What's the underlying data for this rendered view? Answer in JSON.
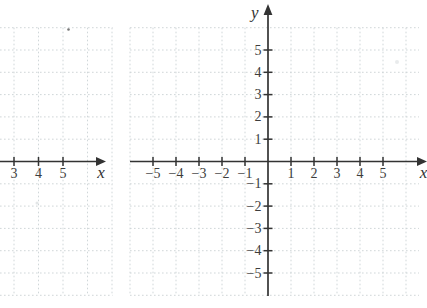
{
  "figure": {
    "background": "#ffffff"
  },
  "colors": {
    "axis": "#333333",
    "tick_label": "#3d3d3d",
    "grid": "#ccd3d5"
  },
  "chart_data": [
    {
      "type": "scatter",
      "title": "",
      "xlabel": "x",
      "ylabel": "",
      "x_ticks": [
        3,
        4,
        5
      ],
      "x_tick_labels": [
        "3",
        "4",
        "5"
      ],
      "y_ticks": [],
      "y_tick_labels": [],
      "grid": true,
      "legend": false,
      "series": [],
      "note": "left coordinate plane, cropped by image edge; only x-axis ticks 3 to 5 and right arrow visible"
    },
    {
      "type": "scatter",
      "title": "",
      "xlabel": "x",
      "ylabel": "y",
      "x_ticks": [
        -5,
        -4,
        -3,
        -2,
        -1,
        1,
        2,
        3,
        4,
        5
      ],
      "x_tick_labels": [
        "−5",
        "−4",
        "−3",
        "−2",
        "−1",
        "1",
        "2",
        "3",
        "4",
        "5"
      ],
      "y_ticks": [
        5,
        4,
        3,
        2,
        1,
        -1,
        -2,
        -3,
        -4,
        -5
      ],
      "y_tick_labels": [
        "5",
        "4",
        "3",
        "2",
        "1",
        "−1",
        "−2",
        "−3",
        "−4",
        "−5"
      ],
      "xlim": [
        -6,
        6
      ],
      "ylim": [
        -6,
        6
      ],
      "grid": true,
      "legend": false,
      "series": []
    }
  ]
}
